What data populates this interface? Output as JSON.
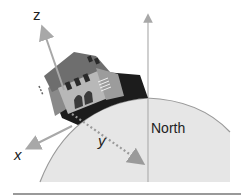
{
  "diagram": {
    "axes": {
      "z_label": "z",
      "x_label": "x",
      "y_label": "y"
    },
    "north_label": "North",
    "colors": {
      "globe_fill": "#e6e6e6",
      "globe_edge": "#9a9a9a",
      "axis_arrow": "#a8a8a8",
      "y_dotted": "#9a9a9a",
      "north_line": "#b0b0b0",
      "baseline": "#777777",
      "house_roof": "#6e6e6e",
      "house_wall": "#b8b8b8",
      "house_dark": "#1c1c1c"
    }
  }
}
